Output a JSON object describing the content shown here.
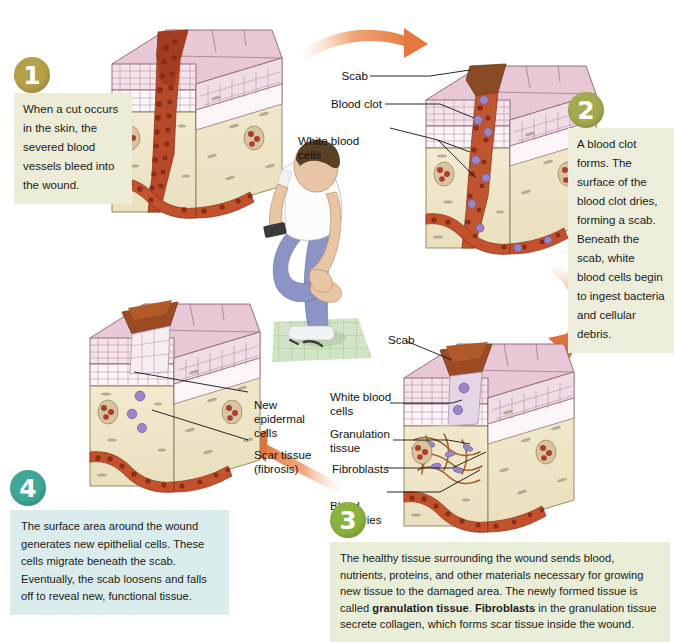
{
  "figure": {
    "type": "medical-illustration"
  },
  "colors": {
    "badge_1": "#b9a košt",
    "arrow_orange": "#e8814a",
    "panel_cream": "#ecebd6",
    "panel_green": "#e8eedb",
    "panel_teal": "#d9edea"
  },
  "stages": [
    {
      "number": "1",
      "badge_color": "#b5a04a",
      "panel_color": "#edecd7",
      "text": "When a cut occurs in the skin, the severed blood vessels bleed into the wound.",
      "labels": []
    },
    {
      "number": "2",
      "badge_color": "#a3aa4f",
      "panel_color": "#eceedb",
      "text": "A blood clot forms. The surface of the blood clot dries, forming a scab. Beneath the scab, white blood cells begin to ingest bacteria and cellular debris.",
      "labels": [
        "Scab",
        "Blood clot",
        "White blood cells"
      ]
    },
    {
      "number": "3",
      "badge_color": "#8ab23f",
      "panel_color": "#e9eed9",
      "text_parts": [
        {
          "t": "The healthy tissue surrounding the wound sends blood, nutrients, proteins, and other materials necessary for growing new tissue to the damaged area. The newly formed tissue is called ",
          "b": false
        },
        {
          "t": "granulation tissue",
          "b": true
        },
        {
          "t": ". ",
          "b": false
        },
        {
          "t": "Fibroblasts",
          "b": true
        },
        {
          "t": " in the granulation tissue secrete collagen, which forms scar tissue inside the wound.",
          "b": false
        }
      ],
      "labels": [
        "Scab",
        "White blood cells",
        "Granulation tissue",
        "Fibroblasts",
        "Blood capillaries"
      ]
    },
    {
      "number": "4",
      "badge_color": "#3fa798",
      "panel_color": "#daeceb",
      "text": "The surface area around the wound generates new epithelial cells. These cells migrate beneath the scab. Eventually, the scab loosens and falls off to reveal new, functional tissue.",
      "labels": [
        "New epidermal cells",
        "Scar tissue (fibrosis)"
      ]
    }
  ],
  "callouts": {
    "s2_scab": "Scab",
    "s2_blood_clot": "Blood clot",
    "s2_wbc": "White blood\ncells",
    "s3_scab": "Scab",
    "s3_wbc": "White blood\ncells",
    "s3_gran": "Granulation\ntissue",
    "s3_fibro": "Fibroblasts",
    "s3_cap": "Blood\ncapillaries",
    "s4_new": "New\nepidermal\ncells",
    "s4_scar": "Scar tissue\n(fibrosis)"
  },
  "panel_text": {
    "stage1": "When a cut occurs in the skin, the severed blood vessels bleed into the wound.",
    "stage2": "A blood clot forms. The surface of the blood clot dries, forming a scab. Beneath the scab, white blood cells begin to ingest bacteria and cellular debris.",
    "stage4": "The surface area around the wound generates new epithelial cells. These cells migrate beneath the scab. Eventually, the scab loosens and falls off to reveal new, functional tissue."
  },
  "stage3_text": {
    "seg1": "The healthy tissue surrounding the wound sends blood, nutrients, proteins, and other materials necessary for growing new tissue to the damaged area. The newly formed tissue is called ",
    "bold1": "granulation tissue",
    "seg2": ". ",
    "bold2": "Fibroblasts",
    "seg3": " in the granulation tissue secrete collagen, which forms scar tissue inside the wound."
  },
  "badges": {
    "one": "1",
    "two": "2",
    "three": "3",
    "four": "4"
  }
}
